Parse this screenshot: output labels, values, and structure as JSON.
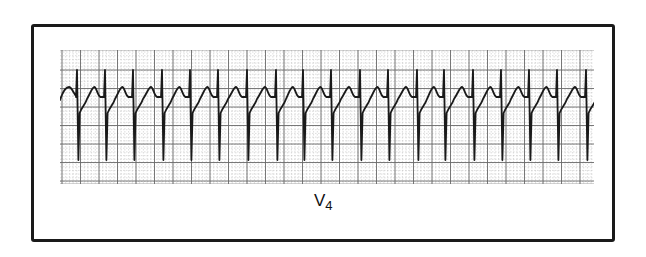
{
  "figure": {
    "type": "ecg-rhythm-strip",
    "lead_label": "V",
    "lead_subscript": "4",
    "colors": {
      "trace": "#1a1a1a",
      "grid_major": "#6a6a6a",
      "grid_minor": "#c4c4c4",
      "frame": "#1a1a1a",
      "background": "#ffffff"
    },
    "strip": {
      "x": 60,
      "y": 50,
      "width": 534,
      "height": 134,
      "major_grid_spacing_px": 18.5,
      "minor_per_major": 5,
      "baseline_y": 95,
      "beat_count": 19,
      "r_spike_x": [
        77,
        105,
        133,
        162,
        190,
        218,
        247,
        276,
        303,
        331,
        360,
        388,
        417,
        444,
        473,
        501,
        529,
        557,
        586
      ],
      "r_peak_y": 70,
      "s_nadir_y": 160,
      "t_peak_y": 87,
      "rhythm_description": "regular narrow-complex tachycardia with deep S waves and peaked T waves"
    }
  }
}
